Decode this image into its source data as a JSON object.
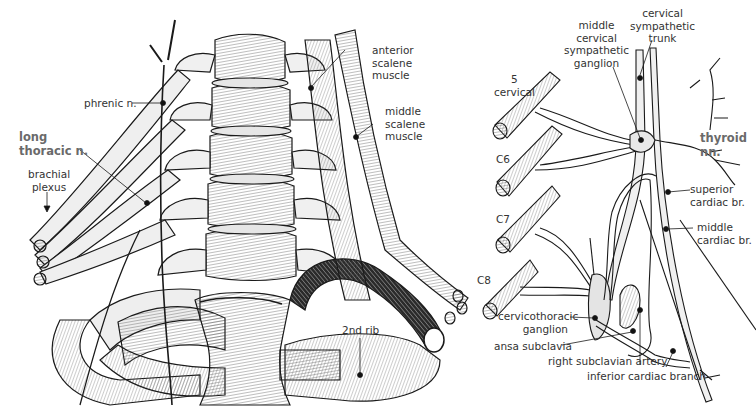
{
  "figure": {
    "left_panel": {
      "title": "Anterior view of neck: brachial plexus, scalene muscles, ribs",
      "labels": {
        "phrenic": "phrenic n.",
        "long_thoracic": [
          "long",
          "thoracic n."
        ],
        "brachial_plexus": [
          "brachial",
          "plexus"
        ],
        "anterior_scalene": [
          "anterior",
          "scalene",
          "muscle"
        ],
        "middle_scalene": [
          "middle",
          "scalene",
          "muscle"
        ],
        "second_rib": "2nd rib"
      }
    },
    "right_panel": {
      "title": "Cervical sympathetic trunk and cardiac branches",
      "labels": {
        "c5": [
          "5",
          "cervical"
        ],
        "c6": "C6",
        "c7": "C7",
        "c8": "C8",
        "middle_ganglion": [
          "middle",
          "cervical",
          "sympathetic",
          "ganglion"
        ],
        "sympathetic_trunk": [
          "cervical",
          "sympathetic",
          "trunk"
        ],
        "thyroid": [
          "thyroid",
          "nn."
        ],
        "superior_cardiac": [
          "superior",
          "cardiac br."
        ],
        "middle_cardiac": [
          "middle",
          "cardiac br."
        ],
        "cervicothoracic": [
          "cervicothoracic",
          "ganglion"
        ],
        "ansa": "ansa subclavia",
        "subclavian": "right subclavian artery",
        "inferior_cardiac": "inferior cardiac branch"
      }
    },
    "colors": {
      "ink": "#1a1a1a",
      "label_text": "#333333",
      "emphasis_label": "#6a6a6a",
      "fill_light": "#f2f2f2",
      "fill_mid": "#dcdcdc",
      "background": "#ffffff"
    }
  }
}
